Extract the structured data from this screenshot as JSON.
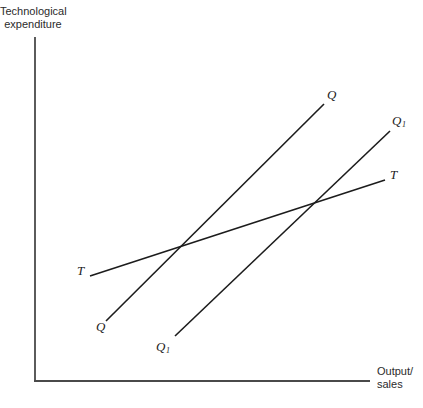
{
  "figure": {
    "background": "#ffffff",
    "axis_color": "#4a4a4a",
    "line_color": "#1c1c1c",
    "text_color": "#2b2b2b"
  },
  "axes": {
    "y_label_line1": "Technological",
    "y_label_line2": "expenditure",
    "x_label_line1": "Output/",
    "x_label_line2": "sales"
  },
  "labels": {
    "q_top": "Q",
    "q1_top_main": "Q",
    "q1_top_sub": "1",
    "t_right": "T",
    "t_left": "T",
    "q_bottom": "Q",
    "q1_bottom_main": "Q",
    "q1_bottom_sub": "1"
  },
  "geometry": {
    "axes": {
      "y_axis": {
        "x1": 35,
        "y1": 37,
        "x2": 35,
        "y2": 381
      },
      "x_axis": {
        "x1": 34,
        "y1": 381,
        "x2": 370,
        "y2": 381
      }
    },
    "lines": [
      {
        "name": "curve-q",
        "x1": 106,
        "y1": 321,
        "x2": 324,
        "y2": 104
      },
      {
        "name": "curve-q1",
        "x1": 175,
        "y1": 336,
        "x2": 390,
        "y2": 131
      },
      {
        "name": "curve-t",
        "x1": 90,
        "y1": 276,
        "x2": 385,
        "y2": 180
      }
    ]
  },
  "chart_data": {
    "type": "line",
    "title": "",
    "xlabel": "Output/sales",
    "ylabel": "Technological expenditure",
    "grid": false,
    "axes_quantitative": false,
    "series": [
      {
        "name": "Q",
        "description": "steep upward-sloping straight line, labelled Q at both ends"
      },
      {
        "name": "Q1",
        "description": "steep upward-sloping straight line parallel to Q, shifted right, labelled Q1 at both ends"
      },
      {
        "name": "T",
        "description": "shallow upward-sloping straight line crossing Q and Q1, labelled T at both ends"
      }
    ]
  }
}
